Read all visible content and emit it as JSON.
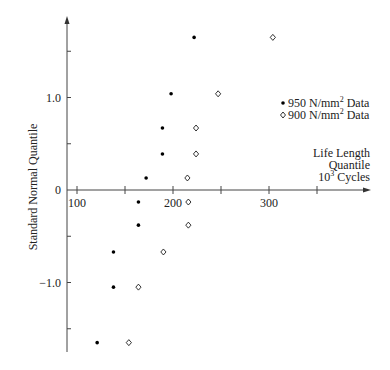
{
  "chart_data": {
    "type": "scatter",
    "title": "",
    "xlabel": [
      "Life Length",
      "Quantile",
      "10³ Cycles"
    ],
    "ylabel": "Standard Normal Quantile",
    "xlim": [
      90,
      375
    ],
    "ylim": [
      -1.75,
      1.85
    ],
    "x_ticks": [
      100,
      150,
      200,
      250,
      300,
      350
    ],
    "x_tick_labels": [
      "100",
      "",
      "200",
      "",
      "300",
      ""
    ],
    "y_ticks": [
      1.5,
      1.0,
      0.5,
      0,
      -0.5,
      -1.0,
      -1.5
    ],
    "y_tick_labels": [
      "",
      "1.0",
      "",
      "0",
      "",
      "−1.0",
      ""
    ],
    "grid": false,
    "legend_position": "upper right",
    "series": [
      {
        "name": "950 N/mm² Data",
        "legend_prefix": "950 N/mm",
        "legend_sup": "2",
        "legend_suffix": " Data",
        "marker": "dot",
        "color": "#000000",
        "points": [
          [
            222,
            1.65
          ],
          [
            198,
            1.04
          ],
          [
            189,
            0.67
          ],
          [
            189,
            0.39
          ],
          [
            172,
            0.13
          ],
          [
            164,
            -0.13
          ],
          [
            164,
            -0.38
          ],
          [
            138,
            -0.67
          ],
          [
            138,
            -1.05
          ],
          [
            121,
            -1.65
          ]
        ]
      },
      {
        "name": "900 N/mm² Data",
        "legend_prefix": "900 N/mm",
        "legend_sup": "2",
        "legend_suffix": " Data",
        "marker": "open-diamond",
        "color": "#000000",
        "points": [
          [
            304,
            1.65
          ],
          [
            247,
            1.04
          ],
          [
            224,
            0.67
          ],
          [
            224,
            0.39
          ],
          [
            215,
            0.13
          ],
          [
            216,
            -0.13
          ],
          [
            216,
            -0.38
          ],
          [
            190,
            -0.67
          ],
          [
            164,
            -1.05
          ],
          [
            154,
            -1.65
          ]
        ]
      }
    ],
    "xlabel_lines": {
      "line1": "Life Length",
      "line2": "Quantile",
      "line3_base": "10",
      "line3_sup": "3",
      "line3_rest": " Cycles"
    }
  }
}
